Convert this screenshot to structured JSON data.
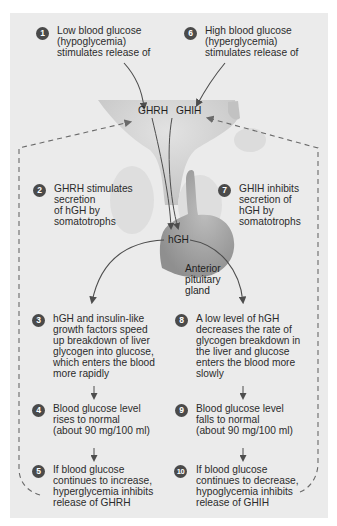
{
  "diagram": {
    "hormones": {
      "ghrh": "GHRH",
      "ghih": "GHIH",
      "hgh": "hGH"
    },
    "gland_label": "Anterior\npituitary\ngland",
    "steps": [
      {
        "number": "1",
        "text": "Low blood glucose\n(hypoglycemia)\nstimulates release of"
      },
      {
        "number": "2",
        "text": "GHRH stimulates\nsecretion\nof hGH by\nsomatotrophs"
      },
      {
        "number": "3",
        "text": "hGH and insulin-like\ngrowth factors speed\nup breakdown of liver\nglycogen into glucose,\nwhich enters the blood\nmore rapidly"
      },
      {
        "number": "4",
        "text": "Blood glucose level\nrises to normal\n(about 90 mg/100 ml)"
      },
      {
        "number": "5",
        "text": "If blood glucose\ncontinues to increase,\nhyperglycemia inhibits\nrelease of GHRH"
      },
      {
        "number": "6",
        "text": "High blood glucose\n(hyperglycemia)\nstimulates release of"
      },
      {
        "number": "7",
        "text": "GHIH inhibits\nsecretion of\nhGH by\nsomatotrophs"
      },
      {
        "number": "8",
        "text": "A low level of hGH\ndecreases the rate of\nglycogen breakdown in\nthe liver and glucose\nenters the blood more\nslowly"
      },
      {
        "number": "9",
        "text": "Blood glucose level\nfalls to normal\n(about 90 mg/100 ml)"
      },
      {
        "number": "10",
        "text": "If blood glucose\ncontinues to decrease,\nhypoglycemia inhibits\nrelease of GHIH"
      }
    ],
    "colors": {
      "panel": "#ebebeb",
      "badge": "#4a4a4a",
      "arrow": "#4d4d4d",
      "dashed_loop": "#6a6a6a",
      "hypothalamus": "#cfcfcf",
      "pituitary": "#a9a9a9"
    }
  }
}
